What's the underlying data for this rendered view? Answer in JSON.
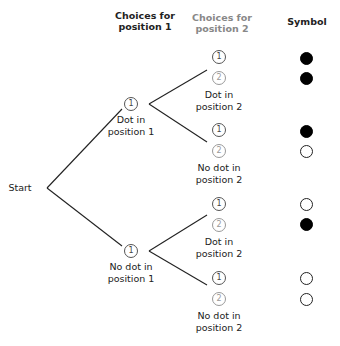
{
  "headers": {
    "position1": [
      "Choices for",
      "position 1"
    ],
    "position2": [
      "Choices for",
      "position 2"
    ],
    "symbol": "Symbol"
  },
  "start_label": "Start",
  "level1": [
    {
      "choice": "1",
      "label": [
        "Dot in",
        "position 1"
      ]
    },
    {
      "choice": "1",
      "label": [
        "No dot in",
        "position 1"
      ]
    }
  ],
  "level2": [
    {
      "choices": [
        "1",
        "2"
      ],
      "label": [
        "Dot in",
        "position 2"
      ],
      "symbols": [
        "filled",
        "filled"
      ]
    },
    {
      "choices": [
        "1",
        "2"
      ],
      "label": [
        "No dot in",
        "position 2"
      ],
      "symbols": [
        "filled",
        "empty"
      ]
    },
    {
      "choices": [
        "1",
        "2"
      ],
      "label": [
        "Dot in",
        "position 2"
      ],
      "symbols": [
        "empty",
        "filled"
      ]
    },
    {
      "choices": [
        "1",
        "2"
      ],
      "label": [
        "No dot in",
        "position 2"
      ],
      "symbols": [
        "empty",
        "empty"
      ]
    }
  ],
  "colors": {
    "position1": "#222222",
    "position2": "#888888",
    "filled_symbol": "#000000"
  }
}
